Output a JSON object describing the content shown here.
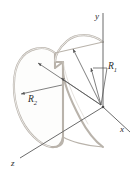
{
  "figure": {
    "background_color": "#ffffff",
    "shell_stroke_color": "#b9b3ab",
    "shell_fill_color": "#fdfdfc",
    "axis_color": "#6b6b6b",
    "leader_color": "#555555",
    "label_color": "#2b2b2b"
  },
  "axes": {
    "y": {
      "label": "y",
      "direction": "up",
      "origin_px": [
        103,
        107
      ],
      "tip_px": [
        103,
        12
      ]
    },
    "x": {
      "label": "x",
      "direction": "down-right",
      "origin_px": [
        103,
        107
      ],
      "tip_px": [
        131,
        133
      ]
    },
    "z": {
      "label": "z",
      "direction": "down-left",
      "origin_px": [
        103,
        107
      ],
      "tip_px": [
        18,
        159
      ]
    }
  },
  "dimensions": [
    {
      "name": "R_1",
      "label": "R",
      "subscript": "1",
      "description": "inner radius, leader lines from origin to near and far arcs"
    },
    {
      "name": "R_2",
      "label": "R",
      "subscript": "2",
      "description": "outer radius, measured across the rear face"
    }
  ],
  "labels": {
    "y_axis": "y",
    "x_axis": "x",
    "z_axis": "z",
    "r1_main": "R",
    "r1_sub": "1",
    "r2_main": "R",
    "r2_sub": "2"
  }
}
